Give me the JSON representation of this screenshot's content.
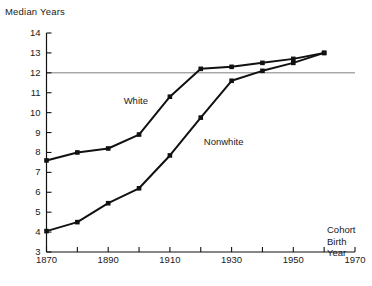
{
  "chart_data": {
    "type": "line",
    "title": "",
    "ylabel": "Median Years",
    "xlabel": "Cohort Birth Year",
    "x": [
      1870,
      1880,
      1890,
      1900,
      1910,
      1920,
      1930,
      1940,
      1950,
      1960
    ],
    "xlim": [
      1870,
      1970
    ],
    "ylim": [
      3,
      14
    ],
    "xticks": [
      1870,
      1880,
      1890,
      1900,
      1910,
      1920,
      1930,
      1940,
      1950,
      1960,
      1970
    ],
    "xtick_labels_shown": [
      "1870",
      "1890",
      "1910",
      "1930",
      "1950",
      "1970"
    ],
    "yticks": [
      3,
      4,
      5,
      6,
      7,
      8,
      9,
      10,
      11,
      12,
      13,
      14
    ],
    "ytick_labels": [
      "3",
      "4",
      "5",
      "6",
      "7",
      "8",
      "9",
      "10",
      "11",
      "12",
      "13",
      "14"
    ],
    "grid": false,
    "reference_line": {
      "value": 12,
      "color": "#808080",
      "orientation": "horizontal"
    },
    "legend_position": "inline-annotations",
    "markers": "filled-square",
    "line_color": "#111111",
    "series": [
      {
        "name": "White",
        "values": [
          7.6,
          8.0,
          8.2,
          8.9,
          10.8,
          12.2,
          12.3,
          12.5,
          12.7,
          13.0
        ]
      },
      {
        "name": "Nonwhite",
        "values": [
          4.05,
          4.5,
          5.45,
          6.2,
          7.85,
          9.75,
          11.6,
          12.1,
          12.5,
          13.0
        ]
      }
    ],
    "annotations": [
      {
        "text": "White",
        "x": 1895,
        "y": 10.6
      },
      {
        "text": "Nonwhite",
        "x": 1921,
        "y": 8.55
      }
    ]
  },
  "axis_caption": {
    "line1": "Cohort",
    "line2": "Birth",
    "line3": "Year"
  }
}
